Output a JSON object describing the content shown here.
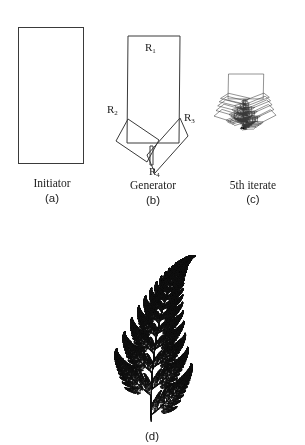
{
  "figure": {
    "panels": [
      {
        "id": "a",
        "caption": "Initiator",
        "sublabel": "(a)"
      },
      {
        "id": "b",
        "caption": "Generator",
        "sublabel": "(b)",
        "region_labels": [
          {
            "name": "R",
            "sub": "1"
          },
          {
            "name": "R",
            "sub": "2"
          },
          {
            "name": "R",
            "sub": "3"
          },
          {
            "name": "R",
            "sub": "4"
          }
        ]
      },
      {
        "id": "c",
        "caption": "5th iterate",
        "sublabel": "(c)"
      },
      {
        "id": "d",
        "caption": "",
        "sublabel": "(d)"
      }
    ],
    "colors": {
      "stroke": "#3a3a3a",
      "fern": "#111111",
      "background": "#ffffff"
    },
    "iterate_depth": 5
  }
}
